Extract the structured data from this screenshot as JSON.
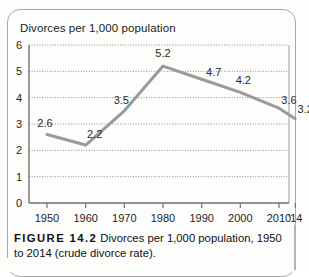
{
  "figure": {
    "caption_label": "FIGURE 14.2",
    "caption_text": " Divorces per 1,000 population, 1950 to 2014 (crude divorce rate)."
  },
  "chart_data": {
    "type": "line",
    "title": "",
    "axis_title": "Divorces per 1,000 population",
    "xlabel": "",
    "ylabel": "Divorces per 1,000 population",
    "categories": [
      "1950",
      "1960",
      "1970",
      "1980",
      "1990",
      "2000",
      "2010",
      "'14"
    ],
    "x": [
      1950,
      1960,
      1970,
      1980,
      1990,
      2000,
      2010,
      2014
    ],
    "values": [
      2.6,
      2.2,
      3.5,
      5.2,
      4.7,
      4.2,
      3.6,
      3.2
    ],
    "point_labels": [
      "2.6",
      "2.2",
      "3.5",
      "5.2",
      "4.7",
      "4.2",
      "3.6",
      "3.2"
    ],
    "ylim": [
      0,
      6
    ],
    "yticks": [
      0,
      1,
      2,
      3,
      4,
      5,
      6
    ],
    "ytick_labels": [
      "0",
      "1",
      "2",
      "3",
      "4",
      "5",
      "6"
    ],
    "grid": true,
    "grid_style": "dotted",
    "legend": false,
    "line_color": "#9a9a9a",
    "text_color": "#1d1d1d",
    "frame_color": "#a8a8a8"
  }
}
